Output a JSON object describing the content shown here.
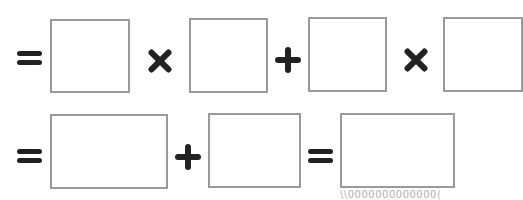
{
  "worksheet": {
    "row1": {
      "symbols": [
        "=",
        "×",
        "+",
        "×"
      ],
      "boxes": [
        "",
        "",
        "",
        ""
      ]
    },
    "row2": {
      "symbols": [
        "=",
        "+",
        "="
      ],
      "boxes": [
        "",
        "",
        ""
      ]
    },
    "footer_fragment": "\\\\0000000000000("
  },
  "colors": {
    "box_border": "#9a9a9a",
    "symbol": "#222222",
    "background": "#ffffff"
  }
}
